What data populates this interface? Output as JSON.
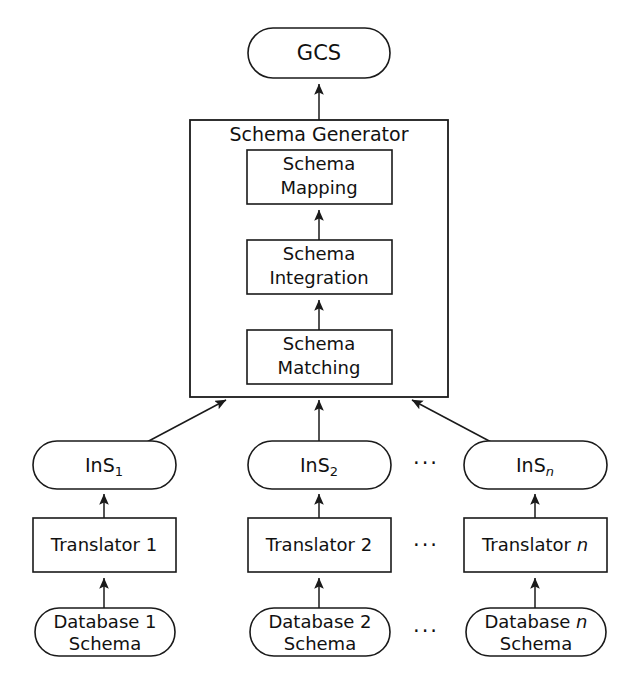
{
  "diagram": {
    "type": "flowchart",
    "colors": {
      "background": "#ffffff",
      "stroke": "#1a1a1a",
      "text": "#111111",
      "node_fill": "#ffffff"
    },
    "output_node": {
      "label": "GCS",
      "shape": "stadium"
    },
    "generator": {
      "title": "Schema Generator",
      "shape": "rectangle",
      "stages": [
        {
          "line1": "Schema",
          "line2": "Mapping",
          "shape": "rectangle"
        },
        {
          "line1": "Schema",
          "line2": "Integration",
          "shape": "rectangle"
        },
        {
          "line1": "Schema",
          "line2": "Matching",
          "shape": "rectangle"
        }
      ]
    },
    "columns": [
      {
        "intermediate": {
          "base": "InS",
          "subscript": "1",
          "subscript_italic": false,
          "shape": "stadium"
        },
        "translator": {
          "base": "Translator",
          "suffix": "1",
          "suffix_italic": false,
          "shape": "rectangle"
        },
        "source": {
          "base": "Database",
          "suffix": "1",
          "suffix_italic": false,
          "line2": "Schema",
          "shape": "stadium"
        }
      },
      {
        "intermediate": {
          "base": "InS",
          "subscript": "2",
          "subscript_italic": false,
          "shape": "stadium"
        },
        "translator": {
          "base": "Translator",
          "suffix": "2",
          "suffix_italic": false,
          "shape": "rectangle"
        },
        "source": {
          "base": "Database",
          "suffix": "2",
          "suffix_italic": false,
          "line2": "Schema",
          "shape": "stadium"
        }
      },
      {
        "intermediate": {
          "base": "InS",
          "subscript": "n",
          "subscript_italic": true,
          "shape": "stadium"
        },
        "translator": {
          "base": "Translator",
          "suffix": "n",
          "suffix_italic": true,
          "shape": "rectangle"
        },
        "source": {
          "base": "Database",
          "suffix": "n",
          "suffix_italic": true,
          "line2": "Schema",
          "shape": "stadium"
        }
      }
    ],
    "ellipses": [
      {
        "label": "···",
        "row": "intermediate"
      },
      {
        "label": "···",
        "row": "translator"
      },
      {
        "label": "···",
        "row": "source"
      }
    ]
  }
}
